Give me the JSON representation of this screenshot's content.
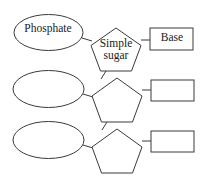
{
  "diagram": {
    "background_color": "#ffffff",
    "stroke_color": "#3a3a3a",
    "text_color": "#1a1a1a",
    "rows": [
      {
        "index": 1,
        "phosphate_label": "Phosphate",
        "sugar_label_line1": "Simple",
        "sugar_label_line2": "sugar",
        "base_label": "Base"
      },
      {
        "index": 2,
        "phosphate_label": "",
        "sugar_label_line1": "",
        "sugar_label_line2": "",
        "base_label": ""
      },
      {
        "index": 3,
        "phosphate_label": "",
        "sugar_label_line1": "",
        "sugar_label_line2": "",
        "base_label": ""
      }
    ]
  }
}
